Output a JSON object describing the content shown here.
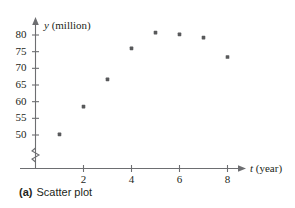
{
  "caption": {
    "tag": "(a)",
    "text": "Scatter plot"
  },
  "axes": {
    "x_title_var": "t",
    "x_title_unit": "(year)",
    "y_title_var": "y",
    "y_title_unit": "(million)",
    "x_ticks": [
      "2",
      "4",
      "6",
      "8"
    ],
    "y_ticks": [
      "80",
      "75",
      "70",
      "65",
      "60",
      "55",
      "50"
    ],
    "break_symbol": "axis-break-zigzag"
  },
  "style": {
    "axis_color": "#6d6e71",
    "point_color": "#58595b",
    "text_color": "#231f20"
  },
  "chart_data": {
    "type": "scatter",
    "title": "",
    "xlabel": "t (year)",
    "ylabel": "y (million)",
    "xlim": [
      0,
      8.8
    ],
    "ylim": [
      48.5,
      82.5
    ],
    "xticks": [
      2,
      4,
      6,
      8
    ],
    "yticks": [
      50,
      55,
      60,
      65,
      70,
      75,
      80
    ],
    "grid": false,
    "legend": false,
    "y_axis_break": true,
    "x": [
      1,
      2,
      3,
      4,
      5,
      6,
      7,
      8
    ],
    "y": [
      50.2,
      58.5,
      66.7,
      76.0,
      80.7,
      80.2,
      79.2,
      73.4
    ],
    "points": [
      {
        "t": 1,
        "y": 50.2
      },
      {
        "t": 2,
        "y": 58.5
      },
      {
        "t": 3,
        "y": 66.7
      },
      {
        "t": 4,
        "y": 76.0
      },
      {
        "t": 5,
        "y": 80.7
      },
      {
        "t": 6,
        "y": 80.2
      },
      {
        "t": 7,
        "y": 79.2
      },
      {
        "t": 8,
        "y": 73.4
      }
    ]
  }
}
